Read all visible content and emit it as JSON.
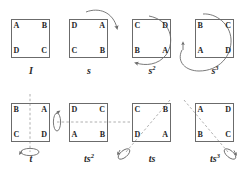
{
  "figure": {
    "background_color": "#ffffff",
    "stroke_color": "#6b6b6b",
    "text_color": "#262626",
    "axis_style": "dashed",
    "corner_order": [
      "tl",
      "tr",
      "br",
      "bl"
    ],
    "panels": [
      {
        "id": "identity",
        "label": "I",
        "exponent": "",
        "corners": {
          "tl": "A",
          "tr": "B",
          "br": "C",
          "bl": "D"
        },
        "motion": "none",
        "axis": "none"
      },
      {
        "id": "rotation-90",
        "label": "s",
        "exponent": "",
        "corners": {
          "tl": "D",
          "tr": "A",
          "br": "B",
          "bl": "C"
        },
        "motion": "curved-arrow-over-top-right",
        "axis": "none"
      },
      {
        "id": "rotation-180",
        "label": "s",
        "exponent": "2",
        "corners": {
          "tl": "C",
          "tr": "D",
          "br": "A",
          "bl": "B"
        },
        "motion": "large-arc-arrow-left",
        "axis": "none"
      },
      {
        "id": "rotation-270",
        "label": "s",
        "exponent": "3",
        "corners": {
          "tl": "B",
          "tr": "C",
          "br": "D",
          "bl": "A"
        },
        "motion": "large-arc-arrow-up",
        "axis": "none"
      },
      {
        "id": "reflection-vertical",
        "label": "t",
        "exponent": "",
        "corners": {
          "tl": "B",
          "tr": "A",
          "br": "D",
          "bl": "C"
        },
        "motion": "flip-ellipse-bottom",
        "axis": "vertical"
      },
      {
        "id": "reflection-horizontal",
        "label": "ts",
        "exponent": "2",
        "corners": {
          "tl": "D",
          "tr": "C",
          "br": "B",
          "bl": "A"
        },
        "motion": "flip-ellipse-left",
        "axis": "horizontal"
      },
      {
        "id": "reflection-diagonal-up",
        "label": "ts",
        "exponent": "",
        "corners": {
          "tl": "C",
          "tr": "B",
          "br": "A",
          "bl": "D"
        },
        "motion": "flip-ellipse-bottom-left",
        "axis": "diagonal-up"
      },
      {
        "id": "reflection-diagonal-down",
        "label": "ts",
        "exponent": "3",
        "corners": {
          "tl": "A",
          "tr": "D",
          "br": "C",
          "bl": "B"
        },
        "motion": "flip-ellipse-bottom-right",
        "axis": "diagonal-down"
      }
    ]
  }
}
